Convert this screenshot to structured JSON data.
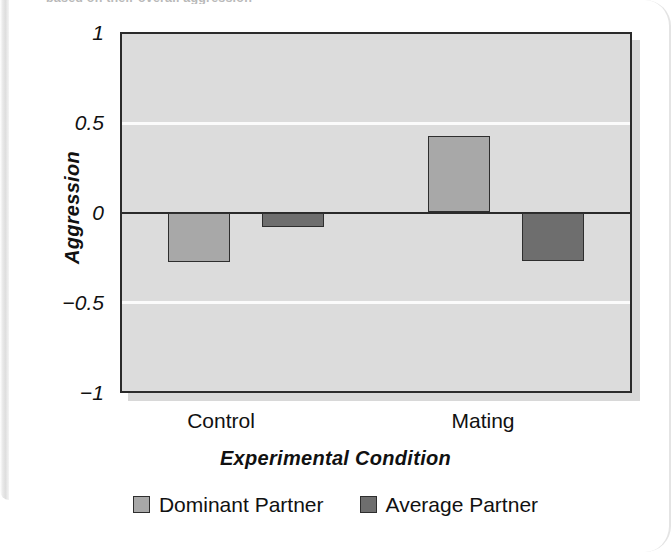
{
  "page": {
    "cropped_header_text": "based on their overall aggression",
    "background_color": "#ffffff"
  },
  "figure": {
    "plot_background": "#dcdcdc",
    "axis_color": "#2b2b2b",
    "gridline_color": "#fbfbfb"
  },
  "chart_data": {
    "type": "bar",
    "title": "",
    "xlabel": "Experimental Condition",
    "ylabel": "Aggression",
    "categories": [
      "Control",
      "Mating"
    ],
    "series": [
      {
        "name": "Dominant Partner",
        "color": "#a8a8a8",
        "values": [
          -0.28,
          0.43
        ]
      },
      {
        "name": "Average Partner",
        "color": "#6e6e6e",
        "values": [
          -0.08,
          -0.27
        ]
      }
    ],
    "ylim": [
      -1,
      1
    ],
    "yticks": [
      1,
      0.5,
      0,
      -0.5,
      -1
    ],
    "ytick_labels": [
      "1",
      "0.5",
      "0",
      "−0.5",
      "−1"
    ],
    "gridlines": [
      0.5,
      -0.5
    ],
    "zero_line": 0,
    "grid": true,
    "legend_position": "bottom-center"
  }
}
